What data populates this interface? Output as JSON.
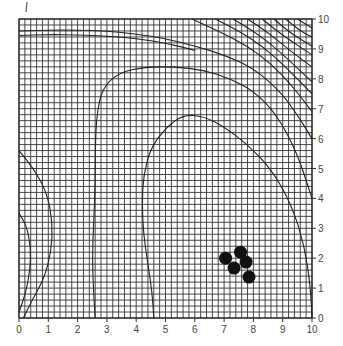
{
  "chart_data": {
    "type": "scatter",
    "subtype": "contour_with_scatter",
    "title": "",
    "xlabel": "",
    "ylabel": "",
    "xlim": [
      0,
      10
    ],
    "ylim": [
      0,
      10
    ],
    "x_ticks": [
      0,
      1,
      2,
      3,
      4,
      5,
      6,
      7,
      8,
      9,
      10
    ],
    "y_ticks": [
      0,
      1,
      2,
      3,
      4,
      5,
      6,
      7,
      8,
      9,
      10
    ],
    "grid": {
      "on": true,
      "spacing": 0.2
    },
    "y_axis_position": "right",
    "legend": null,
    "points": [
      {
        "x": 7.05,
        "y": 2.0
      },
      {
        "x": 7.56,
        "y": 2.2
      },
      {
        "x": 7.75,
        "y": 1.87
      },
      {
        "x": 7.34,
        "y": 1.67
      },
      {
        "x": 7.85,
        "y": 1.37
      }
    ],
    "contours": [
      {
        "id": "c1",
        "points": [
          [
            4.6,
            0
          ],
          [
            4.55,
            0.8
          ],
          [
            4.4,
            1.8
          ],
          [
            4.25,
            2.8
          ],
          [
            4.2,
            3.8
          ],
          [
            4.25,
            4.8
          ],
          [
            4.5,
            5.7
          ],
          [
            5.0,
            6.35
          ],
          [
            5.6,
            6.8
          ],
          [
            6.3,
            6.75
          ],
          [
            7.0,
            6.4
          ],
          [
            7.8,
            5.8
          ],
          [
            8.6,
            5.0
          ],
          [
            9.3,
            3.8
          ],
          [
            9.75,
            2.4
          ],
          [
            9.95,
            1.0
          ],
          [
            10,
            0
          ]
        ]
      },
      {
        "id": "c2",
        "points": [
          [
            2.6,
            0
          ],
          [
            2.55,
            0.8
          ],
          [
            2.5,
            2.0
          ],
          [
            2.55,
            3.2
          ],
          [
            2.6,
            4.4
          ],
          [
            2.6,
            5.6
          ],
          [
            2.65,
            6.8
          ],
          [
            2.85,
            7.7
          ],
          [
            3.4,
            8.2
          ],
          [
            4.3,
            8.4
          ],
          [
            5.3,
            8.4
          ],
          [
            6.3,
            8.3
          ],
          [
            7.2,
            8.0
          ],
          [
            8.0,
            7.6
          ],
          [
            8.8,
            6.8
          ],
          [
            9.5,
            5.5
          ],
          [
            10,
            4.0
          ]
        ]
      },
      {
        "id": "c3",
        "points": [
          [
            0,
            9.6
          ],
          [
            1.0,
            9.63
          ],
          [
            2.0,
            9.63
          ],
          [
            3.0,
            9.6
          ],
          [
            4.0,
            9.5
          ],
          [
            5.0,
            9.35
          ],
          [
            6.0,
            9.1
          ],
          [
            7.0,
            8.8
          ],
          [
            8.0,
            8.35
          ],
          [
            8.9,
            7.6
          ],
          [
            9.5,
            6.8
          ],
          [
            10,
            6.0
          ]
        ]
      },
      {
        "id": "c3b",
        "points": [
          [
            0,
            9.45
          ],
          [
            1.0,
            9.48
          ],
          [
            2.0,
            9.47
          ],
          [
            3.0,
            9.43
          ],
          [
            4.0,
            9.35
          ],
          [
            5.0,
            9.2
          ],
          [
            6.0,
            8.95
          ]
        ]
      },
      {
        "id": "c4",
        "points": [
          [
            5.9,
            10
          ],
          [
            6.8,
            9.6
          ],
          [
            7.8,
            9.1
          ],
          [
            8.6,
            8.5
          ],
          [
            9.3,
            7.8
          ],
          [
            10,
            6.9
          ]
        ]
      },
      {
        "id": "c5",
        "points": [
          [
            6.7,
            10
          ],
          [
            7.5,
            9.6
          ],
          [
            8.3,
            9.1
          ],
          [
            9.1,
            8.4
          ],
          [
            10,
            7.5
          ]
        ]
      },
      {
        "id": "c6",
        "points": [
          [
            7.3,
            10
          ],
          [
            8.0,
            9.6
          ],
          [
            8.8,
            9.0
          ],
          [
            10,
            7.9
          ]
        ]
      },
      {
        "id": "c7",
        "points": [
          [
            7.8,
            10
          ],
          [
            8.5,
            9.55
          ],
          [
            9.3,
            8.9
          ],
          [
            10,
            8.4
          ]
        ]
      },
      {
        "id": "c8",
        "points": [
          [
            8.3,
            10
          ],
          [
            9.0,
            9.45
          ],
          [
            10,
            8.8
          ]
        ]
      },
      {
        "id": "c9",
        "points": [
          [
            8.7,
            10
          ],
          [
            9.3,
            9.5
          ],
          [
            10,
            9.1
          ]
        ]
      },
      {
        "id": "c10",
        "points": [
          [
            9.1,
            10
          ],
          [
            9.6,
            9.6
          ],
          [
            10,
            9.4
          ]
        ]
      },
      {
        "id": "c11",
        "points": [
          [
            9.5,
            10
          ],
          [
            10,
            9.7
          ]
        ]
      },
      {
        "id": "c12",
        "points": [
          [
            0,
            5.6
          ],
          [
            0.5,
            5.0
          ],
          [
            0.95,
            4.2
          ],
          [
            1.15,
            3.2
          ],
          [
            1.1,
            2.2
          ],
          [
            0.85,
            1.3
          ],
          [
            0.45,
            0.6
          ],
          [
            0.15,
            0
          ]
        ]
      },
      {
        "id": "c13",
        "points": [
          [
            0,
            3.5
          ],
          [
            0.25,
            3.1
          ],
          [
            0.4,
            2.4
          ],
          [
            0.38,
            1.6
          ],
          [
            0.22,
            0.8
          ],
          [
            0,
            0.2
          ]
        ]
      }
    ]
  },
  "axes": {
    "x_tick_labels": [
      "0",
      "1",
      "2",
      "3",
      "4",
      "5",
      "6",
      "7",
      "8",
      "9",
      "10"
    ],
    "y_tick_labels": [
      "0",
      "1",
      "2",
      "3",
      "4",
      "5",
      "6",
      "7",
      "8",
      "9",
      "10"
    ]
  },
  "colors": {
    "background": "#ffffff",
    "grid": "#333333",
    "contour": "#222222",
    "points": "#111111"
  }
}
